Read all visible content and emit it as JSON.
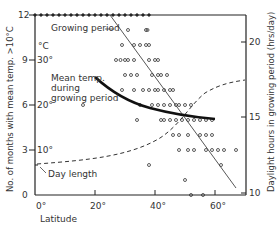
{
  "chart_data": {
    "type": "scatter",
    "title": "",
    "xlabel": "Latitude",
    "ylabel_left": "No. of months with mean temp. >10°C",
    "ylabel_right": "Daylight hours in growing period (hrs/day)",
    "secondary_left_unit": "°C",
    "xlim": [
      0,
      70
    ],
    "ylim_left": [
      0,
      12
    ],
    "ylim_right": [
      10,
      22
    ],
    "x_ticks": [
      "0°",
      "20°",
      "40°",
      "60°"
    ],
    "y_ticks_left": [
      "0",
      "3",
      "6",
      "9",
      "12"
    ],
    "y_ticks_temp": [
      "10°",
      "20°",
      "30°"
    ],
    "y_ticks_right": [
      "10",
      "15",
      "20"
    ],
    "grid": false,
    "annotations": [
      "Growing period",
      "Mean temp. during growing period",
      "Day length"
    ],
    "series": [
      {
        "name": "Growing period (observations)",
        "kind": "scatter",
        "points": [
          [
            0,
            12
          ],
          [
            2,
            12
          ],
          [
            4,
            12
          ],
          [
            6,
            12
          ],
          [
            8,
            12
          ],
          [
            10,
            12
          ],
          [
            12,
            12
          ],
          [
            14,
            12
          ],
          [
            16,
            12
          ],
          [
            18,
            12
          ],
          [
            20,
            12
          ],
          [
            22,
            12
          ],
          [
            24,
            12
          ],
          [
            26,
            12
          ],
          [
            28,
            12
          ],
          [
            30,
            12
          ],
          [
            32,
            12
          ],
          [
            34,
            12
          ],
          [
            36,
            12
          ],
          [
            38,
            12
          ],
          [
            31,
            11
          ],
          [
            37,
            11
          ],
          [
            37.5,
            11
          ],
          [
            29,
            10
          ],
          [
            33,
            10
          ],
          [
            35,
            10
          ],
          [
            37,
            10
          ],
          [
            38,
            10
          ],
          [
            27,
            9
          ],
          [
            28.5,
            9
          ],
          [
            30,
            9
          ],
          [
            31,
            9
          ],
          [
            33,
            9
          ],
          [
            38,
            9
          ],
          [
            40,
            9
          ],
          [
            41,
            9
          ],
          [
            30,
            8
          ],
          [
            32,
            8
          ],
          [
            34,
            8
          ],
          [
            39,
            8
          ],
          [
            41,
            8
          ],
          [
            42,
            8
          ],
          [
            44,
            8
          ],
          [
            29,
            7
          ],
          [
            33,
            7
          ],
          [
            36,
            7
          ],
          [
            38,
            7
          ],
          [
            40,
            7
          ],
          [
            41,
            7
          ],
          [
            43,
            7
          ],
          [
            45,
            7
          ],
          [
            46,
            7
          ],
          [
            35,
            6
          ],
          [
            16,
            6
          ],
          [
            39,
            6
          ],
          [
            41,
            6
          ],
          [
            43,
            6
          ],
          [
            45,
            6
          ],
          [
            47,
            6
          ],
          [
            48,
            6
          ],
          [
            50,
            6
          ],
          [
            52,
            6
          ],
          [
            34,
            5
          ],
          [
            42,
            5
          ],
          [
            43,
            5
          ],
          [
            45,
            5
          ],
          [
            47,
            5
          ],
          [
            49,
            5
          ],
          [
            51,
            5
          ],
          [
            53,
            5
          ],
          [
            55,
            5
          ],
          [
            57,
            5
          ],
          [
            59,
            5
          ],
          [
            46,
            4
          ],
          [
            48,
            4
          ],
          [
            51,
            4
          ],
          [
            55,
            4
          ],
          [
            57,
            4
          ],
          [
            59,
            4
          ],
          [
            48,
            3
          ],
          [
            51,
            3
          ],
          [
            53,
            3
          ],
          [
            57,
            3
          ],
          [
            59,
            3
          ],
          [
            61,
            3
          ],
          [
            63,
            3
          ],
          [
            67,
            3
          ],
          [
            38,
            2
          ],
          [
            62,
            2
          ],
          [
            50,
            1
          ],
          [
            52,
            0
          ],
          [
            56,
            0
          ]
        ]
      },
      {
        "name": "Growing period (trend)",
        "kind": "line",
        "points": [
          [
            25,
            12
          ],
          [
            67,
            0.5
          ]
        ]
      },
      {
        "name": "Mean temp. during growing period",
        "kind": "line",
        "unit": "°C",
        "points": [
          [
            20,
            24
          ],
          [
            25,
            21.5
          ],
          [
            30,
            19.6
          ],
          [
            35,
            18.3
          ],
          [
            40,
            17.1
          ],
          [
            45,
            16.2
          ],
          [
            50,
            15.6
          ],
          [
            55,
            15.3
          ],
          [
            60,
            15.2
          ]
        ]
      },
      {
        "name": "Day length",
        "kind": "dashed-line",
        "unit": "hrs/day",
        "points": [
          [
            0,
            12.0
          ],
          [
            10,
            12.1
          ],
          [
            20,
            12.4
          ],
          [
            30,
            12.9
          ],
          [
            40,
            13.6
          ],
          [
            45,
            14.3
          ],
          [
            50,
            15.3
          ],
          [
            55,
            16.2
          ],
          [
            60,
            16.9
          ],
          [
            65,
            17.3
          ],
          [
            70,
            17.4
          ]
        ]
      }
    ]
  },
  "labels": {
    "growing_period": "Growing period",
    "mean_temp_1": "Mean temp.",
    "mean_temp_2": "during",
    "mean_temp_3": "growing period",
    "day_length": "Day length",
    "deg_c": "°C",
    "xlabel": "Latitude",
    "ylabel_left": "No. of months with mean temp. >10°C",
    "ylabel_right": "Daylight hours in growing period  (hrs/day)",
    "x0": "0°",
    "x20": "20°",
    "x40": "40°",
    "x60": "60°",
    "y0": "0",
    "y3": "3",
    "y6": "6",
    "y9": "9",
    "y12": "12",
    "t10": "10°",
    "t20": "20°",
    "t30": "30°",
    "r10": "10",
    "r15": "15",
    "r20": "20"
  }
}
